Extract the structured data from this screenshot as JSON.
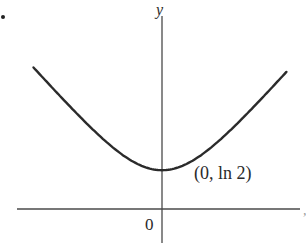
{
  "figure": {
    "bullet": "•",
    "y_axis_label": "y",
    "x_axis_label": "x",
    "origin_label": "0",
    "point_label": "(0, ln 2)",
    "curve_color": "#2b2b2b",
    "axis_color": "#4a4a4a"
  },
  "chart_data": {
    "type": "line",
    "title": "",
    "xlabel": "x",
    "ylabel": "y",
    "function": "y = ln(e^x + e^-x)",
    "annotations": [
      {
        "text": "(0, ln 2)",
        "x": 0,
        "y": 0.693
      },
      {
        "text": "0",
        "x": 0,
        "y": 0
      }
    ],
    "series": [
      {
        "name": "curve",
        "x": [
          -2.5,
          -2.0,
          -1.5,
          -1.0,
          -0.5,
          0,
          0.5,
          1.0,
          1.5,
          2.0,
          2.5
        ],
        "values": [
          2.507,
          2.018,
          1.547,
          1.127,
          0.813,
          0.693,
          0.813,
          1.127,
          1.547,
          2.018,
          2.507
        ]
      }
    ],
    "xlim": [
      -3,
      3
    ],
    "ylim": [
      -0.8,
      2.7
    ],
    "grid": false,
    "legend": "none"
  }
}
